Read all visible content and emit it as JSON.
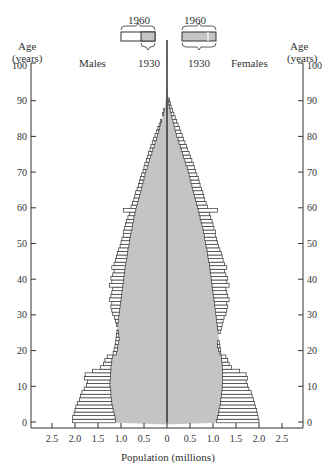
{
  "chart_data": {
    "type": "bar",
    "subtype": "population-pyramid",
    "title": "",
    "xlabel": "Population (millions)",
    "ylabel": "Age (years)",
    "ylabel_right": "Age (years)",
    "xlim": [
      -2.5,
      2.5
    ],
    "ylim": [
      0,
      100
    ],
    "x_ticks": [
      "2.5",
      "2.0",
      "1.5",
      "1.0",
      "0.5",
      "0",
      "0.5",
      "1.0",
      "1.5",
      "2.0",
      "2.5"
    ],
    "y_ticks": [
      "0",
      "10",
      "20",
      "30",
      "40",
      "50",
      "60",
      "70",
      "80",
      "90",
      "100"
    ],
    "left_label": "Males",
    "right_label": "Females",
    "legend": {
      "left": {
        "outer_label": "1960",
        "inner_label": "1930"
      },
      "right": {
        "outer_label": "1960",
        "inner_label": "1930"
      },
      "description": "Outlined bars = 1960; gray shaded = 1930"
    },
    "series": [
      {
        "name": "Males 1930",
        "values": [
          1.12,
          1.13,
          1.15,
          1.17,
          1.18,
          1.2,
          1.21,
          1.22,
          1.22,
          1.23,
          1.24,
          1.24,
          1.23,
          1.23,
          1.22,
          1.22,
          1.21,
          1.2,
          1.18,
          1.17,
          1.15,
          1.13,
          1.12,
          1.11,
          1.1,
          1.09,
          1.08,
          1.07,
          1.06,
          1.05,
          1.04,
          1.03,
          1.02,
          1.01,
          1.0,
          0.99,
          0.98,
          0.97,
          0.96,
          0.95,
          0.94,
          0.93,
          0.92,
          0.91,
          0.9,
          0.88,
          0.87,
          0.86,
          0.85,
          0.83,
          0.82,
          0.81,
          0.79,
          0.78,
          0.76,
          0.75,
          0.73,
          0.72,
          0.7,
          0.68,
          0.66,
          0.64,
          0.62,
          0.6,
          0.58,
          0.56,
          0.54,
          0.52,
          0.5,
          0.48,
          0.46,
          0.43,
          0.41,
          0.38,
          0.36,
          0.33,
          0.31,
          0.28,
          0.26,
          0.23,
          0.21,
          0.18,
          0.16,
          0.14,
          0.12,
          0.1,
          0.08,
          0.06,
          0.05,
          0.04,
          0.03,
          0.02,
          0.015,
          0.01,
          0.005
        ]
      },
      {
        "name": "Males 1960",
        "values": [
          2.05,
          2.05,
          2.02,
          2.0,
          1.98,
          1.95,
          1.9,
          1.88,
          1.85,
          1.8,
          1.75,
          1.73,
          1.8,
          1.78,
          1.62,
          1.45,
          1.38,
          1.35,
          1.3,
          1.1,
          1.08,
          1.07,
          1.05,
          1.04,
          1.05,
          1.06,
          1.08,
          1.1,
          1.12,
          1.14,
          1.18,
          1.2,
          1.22,
          1.2,
          1.25,
          1.22,
          1.2,
          1.18,
          1.25,
          1.2,
          1.22,
          1.18,
          1.15,
          1.2,
          1.15,
          1.12,
          1.1,
          1.08,
          1.05,
          1.02,
          1.0,
          0.98,
          0.95,
          0.95,
          0.92,
          0.9,
          0.88,
          0.85,
          0.82,
          0.95,
          0.78,
          0.75,
          0.72,
          0.7,
          0.68,
          0.65,
          0.62,
          0.6,
          0.58,
          0.55,
          0.52,
          0.5,
          0.48,
          0.45,
          0.42,
          0.4,
          0.37,
          0.35,
          0.32,
          0.29,
          0.26,
          0.23,
          0.2,
          0.17,
          0.14,
          0.12,
          0.1,
          0.08,
          0.06,
          0.04,
          0.03,
          0.02,
          0.015,
          0.01,
          0.005
        ]
      },
      {
        "name": "Females 1930",
        "values": [
          1.08,
          1.1,
          1.12,
          1.13,
          1.15,
          1.16,
          1.17,
          1.18,
          1.19,
          1.2,
          1.2,
          1.21,
          1.21,
          1.21,
          1.21,
          1.2,
          1.2,
          1.19,
          1.18,
          1.17,
          1.16,
          1.15,
          1.14,
          1.13,
          1.12,
          1.11,
          1.1,
          1.09,
          1.08,
          1.07,
          1.06,
          1.05,
          1.04,
          1.03,
          1.02,
          1.01,
          1.0,
          0.99,
          0.98,
          0.97,
          0.96,
          0.95,
          0.94,
          0.93,
          0.92,
          0.9,
          0.89,
          0.88,
          0.87,
          0.85,
          0.84,
          0.82,
          0.81,
          0.79,
          0.78,
          0.76,
          0.74,
          0.72,
          0.7,
          0.68,
          0.66,
          0.64,
          0.62,
          0.6,
          0.58,
          0.56,
          0.54,
          0.52,
          0.5,
          0.48,
          0.46,
          0.44,
          0.41,
          0.39,
          0.36,
          0.34,
          0.31,
          0.29,
          0.26,
          0.24,
          0.21,
          0.19,
          0.17,
          0.15,
          0.13,
          0.11,
          0.09,
          0.07,
          0.05,
          0.04,
          0.03,
          0.02,
          0.015,
          0.01,
          0.005
        ]
      },
      {
        "name": "Females 1960",
        "values": [
          2.0,
          1.98,
          1.97,
          1.95,
          1.92,
          1.9,
          1.88,
          1.85,
          1.83,
          1.78,
          1.75,
          1.72,
          1.75,
          1.72,
          1.58,
          1.4,
          1.35,
          1.32,
          1.28,
          1.15,
          1.12,
          1.1,
          1.1,
          1.12,
          1.14,
          1.16,
          1.18,
          1.2,
          1.22,
          1.24,
          1.28,
          1.3,
          1.32,
          1.3,
          1.35,
          1.32,
          1.3,
          1.28,
          1.35,
          1.3,
          1.32,
          1.28,
          1.25,
          1.3,
          1.25,
          1.22,
          1.2,
          1.18,
          1.15,
          1.12,
          1.1,
          1.08,
          1.05,
          1.05,
          1.02,
          1.0,
          0.98,
          0.95,
          0.92,
          1.1,
          0.88,
          0.85,
          0.82,
          0.8,
          0.78,
          0.75,
          0.72,
          0.7,
          0.68,
          0.65,
          0.62,
          0.6,
          0.57,
          0.54,
          0.51,
          0.48,
          0.45,
          0.42,
          0.39,
          0.36,
          0.33,
          0.3,
          0.27,
          0.24,
          0.21,
          0.18,
          0.15,
          0.12,
          0.09,
          0.07,
          0.05,
          0.03,
          0.02,
          0.01,
          0.005
        ]
      }
    ],
    "age_start": 0,
    "age_step": 1,
    "grid": false
  },
  "labels": {
    "age_left_1": "Age",
    "age_left_2": "(years)",
    "age_right_1": "Age",
    "age_right_2": "(years)",
    "males": "Males",
    "females": "Females",
    "legend_left_top": "1960",
    "legend_left_bottom": "1930",
    "legend_right_top": "1960",
    "legend_right_bottom": "1930",
    "xaxis_title": "Population (millions)"
  }
}
